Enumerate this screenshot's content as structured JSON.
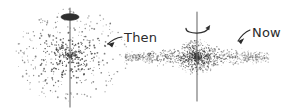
{
  "figure": {
    "type": "diagram",
    "width": 292,
    "height": 111,
    "background_color": "#ffffff",
    "ink_color": "#2b2b2b",
    "dot_color": "#3a3a3a",
    "axis_color": "#6e6e6e"
  },
  "panels": [
    {
      "id": "then",
      "label": "Then",
      "label_position": {
        "x": 124,
        "y": 31
      },
      "shape": "spherical-cloud",
      "cloud": {
        "center_x": 70,
        "center_y": 56,
        "radius_x": 58,
        "radius_y": 48,
        "flatten_ratio": 0.83,
        "dot_count": 560,
        "dot_size_min": 0.7,
        "dot_size_max": 1.9,
        "concentration": 1.25,
        "seed": 20477
      },
      "axis": {
        "x": 70,
        "y_top": 8,
        "y_bottom": 107,
        "width": 1.1
      },
      "rotation_marker": {
        "type": "ellipse-spindle",
        "cx": 70,
        "cy": 17,
        "rx": 9,
        "ry": 3.2,
        "filled": true
      },
      "pointer": {
        "type": "arrow",
        "from": {
          "x": 122,
          "y": 37
        },
        "to": {
          "x": 108,
          "y": 44
        },
        "curve": {
          "x": 114,
          "y": 38
        }
      }
    },
    {
      "id": "now",
      "label": "Now",
      "label_position": {
        "x": 252,
        "y": 26
      },
      "shape": "flattened-disk",
      "cloud": {
        "center_x": 197,
        "center_y": 57,
        "radius_x": 72,
        "radius_y": 20,
        "core_radius_x": 22,
        "core_radius_y": 18,
        "flatten_ratio": 0.28,
        "dot_count": 900,
        "core_dot_count": 620,
        "dot_size_min": 0.5,
        "dot_size_max": 1.6,
        "concentration": 1.9,
        "seed": 88131
      },
      "axis": {
        "x": 197,
        "y_top": 12,
        "y_bottom": 101,
        "width": 1.1
      },
      "rotation_marker": {
        "type": "curved-arrow",
        "cx": 197,
        "cy": 29,
        "rx": 11,
        "ry": 4.2,
        "arrowhead": "right"
      },
      "pointer": {
        "type": "arrow",
        "from": {
          "x": 250,
          "y": 30
        },
        "to": {
          "x": 238,
          "y": 41
        },
        "curve": {
          "x": 243,
          "y": 33
        }
      }
    }
  ]
}
